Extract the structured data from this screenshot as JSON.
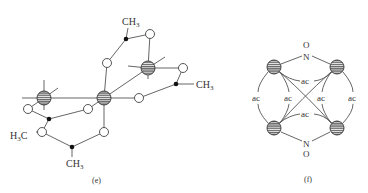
{
  "figure": {
    "panels": [
      {
        "id": "e",
        "caption": "(e)",
        "labels": {
          "ch3_top": "CH",
          "ch3_top_sub": "3",
          "ch3_right": "CH",
          "ch3_right_sub": "3",
          "h3c_left": "H",
          "h3c_left_sub": "3",
          "h3c_left_tail": "C",
          "ch3_bottom": "CH",
          "ch3_bottom_sub": "3"
        }
      },
      {
        "id": "f",
        "caption": "(f)",
        "labels": {
          "o_top": "O",
          "n_top": "N",
          "n_bottom": "N",
          "o_bottom": "O",
          "ac_top": "ac",
          "ac_bottom": "ac",
          "ac_left_outer": "ac",
          "ac_left_inner": "ac",
          "ac_right_inner": "ac",
          "ac_right_outer": "ac"
        }
      }
    ],
    "colors": {
      "background": "#ffffff",
      "line": "#555555",
      "metal_fill": "#777777",
      "metal_stripe": "#ffffff",
      "dot": "#111111"
    }
  }
}
